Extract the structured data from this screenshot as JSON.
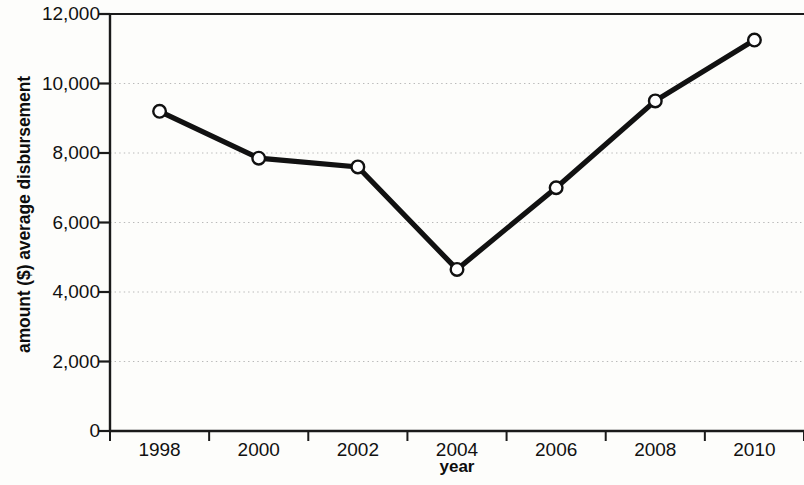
{
  "chart_data": {
    "type": "line",
    "title": "",
    "xlabel": "year",
    "ylabel": "amount ($) average disbursement",
    "categories": [
      "1998",
      "2000",
      "2002",
      "2004",
      "2006",
      "2008",
      "2010"
    ],
    "values": [
      9200,
      7850,
      7600,
      4650,
      7000,
      9500,
      11250
    ],
    "series": [
      {
        "name": "average disbursement",
        "values": [
          9200,
          7850,
          7600,
          4650,
          7000,
          9500,
          11250
        ]
      }
    ],
    "ylim": [
      0,
      12000
    ],
    "ytick_labels": [
      "0",
      "2,000",
      "4,000",
      "6,000",
      "8,000",
      "10,000",
      "12,000"
    ],
    "ytick_values": [
      0,
      2000,
      4000,
      6000,
      8000,
      10000,
      12000
    ],
    "xtick_labels": [
      "1998",
      "2000",
      "2002",
      "2004",
      "2006",
      "2008",
      "2010"
    ],
    "grid": "horizontal-dotted",
    "legend": "none",
    "marker": "open-circle",
    "line_color": "#111111",
    "marker_fill": "#ffffff",
    "grid_color": "#b9b9b9",
    "axis_color": "#1a1a1a",
    "background": "#fdfdfb"
  }
}
